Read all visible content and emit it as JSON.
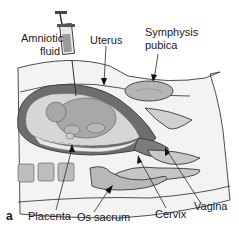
{
  "figure": {
    "panel_label": "a",
    "labels": {
      "amniotic_fluid_line1": "Amniotic",
      "amniotic_fluid_line2": "fluid",
      "uterus": "Uterus",
      "symphysis_line1": "Symphysis",
      "symphysis_line2": "pubica",
      "placenta": "Placenta",
      "os_sacrum": "Os sacrum",
      "cervix": "Cervix",
      "vagina": "Vagina"
    },
    "colors": {
      "uterus_wall": "#6e6e6e",
      "amniotic_fluid": "#d6d6d6",
      "fetus": "#a8a8a8",
      "bone": "#bdbdbd",
      "tissue": "#f0f0f0",
      "outline": "#3a3a3a"
    }
  }
}
